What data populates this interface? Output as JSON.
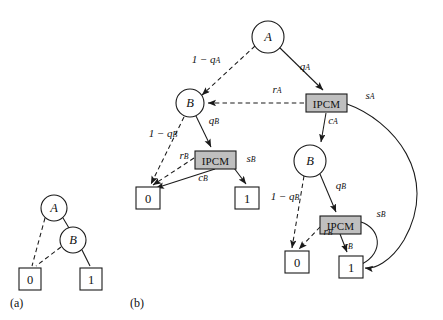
{
  "figure": {
    "background_color": "#ffffff",
    "stroke_color": "#1a1a1a",
    "ipcm_fill_color": "#bfbfbf",
    "panels": [
      {
        "id": "a",
        "caption": "(a)"
      },
      {
        "id": "b",
        "caption": "(b)"
      }
    ]
  },
  "panel_a": {
    "caption": "(a)",
    "nodes": [
      {
        "id": "a_A",
        "label": "A",
        "shape": "circle",
        "cx": 54,
        "cy": 208,
        "r": 13
      },
      {
        "id": "a_B",
        "label": "B",
        "shape": "circle",
        "cx": 73,
        "cy": 240,
        "r": 13
      },
      {
        "id": "a_leaf0",
        "label": "0",
        "shape": "box",
        "x": 19,
        "y": 268,
        "w": 22,
        "h": 22
      },
      {
        "id": "a_leaf1",
        "label": "1",
        "shape": "box",
        "x": 80,
        "y": 268,
        "w": 22,
        "h": 22
      }
    ],
    "edges": [
      {
        "from": "a_A",
        "to": "a_leaf0",
        "style": "dashed",
        "label": ""
      },
      {
        "from": "a_A",
        "to": "a_B",
        "style": "solid",
        "label": ""
      },
      {
        "from": "a_B",
        "to": "a_leaf0",
        "style": "dashed",
        "label": ""
      },
      {
        "from": "a_B",
        "to": "a_leaf1",
        "style": "solid",
        "label": ""
      }
    ]
  },
  "panel_b": {
    "caption": "(b)",
    "nodes": [
      {
        "id": "b_A",
        "label": "A",
        "shape": "circle",
        "cx": 268,
        "cy": 37,
        "r": 16
      },
      {
        "id": "b_B_left",
        "label": "B",
        "shape": "circle",
        "cx": 190,
        "cy": 103,
        "r": 14
      },
      {
        "id": "b_ipcm_A",
        "label": "IPCM",
        "shape": "ipcm",
        "x": 306,
        "y": 94,
        "w": 41,
        "h": 18
      },
      {
        "id": "b_ipcm_B_left",
        "label": "IPCM",
        "shape": "ipcm",
        "x": 195,
        "y": 151,
        "w": 41,
        "h": 18
      },
      {
        "id": "b_leaf0_left",
        "label": "0",
        "shape": "box",
        "x": 136,
        "y": 187,
        "w": 24,
        "h": 22
      },
      {
        "id": "b_leaf1_left",
        "label": "1",
        "shape": "box",
        "x": 235,
        "y": 187,
        "w": 24,
        "h": 22
      },
      {
        "id": "b_B_right",
        "label": "B",
        "shape": "circle",
        "cx": 310,
        "cy": 161,
        "r": 16
      },
      {
        "id": "b_ipcm_B_right",
        "label": "IPCM",
        "shape": "ipcm",
        "x": 320,
        "y": 216,
        "w": 41,
        "h": 18
      },
      {
        "id": "b_leaf0_right",
        "label": "0",
        "shape": "box",
        "x": 285,
        "y": 251,
        "w": 24,
        "h": 22
      },
      {
        "id": "b_leaf1_right",
        "label": "1",
        "shape": "box",
        "x": 339,
        "y": 256,
        "w": 24,
        "h": 22
      }
    ],
    "edge_labels": {
      "one_minus_qA": {
        "text": "1 − q",
        "sub": "A",
        "x": 206,
        "y": 59
      },
      "qA": {
        "text": "q",
        "sub": "A",
        "x": 305,
        "y": 66
      },
      "rA": {
        "text": "r",
        "sub": "A",
        "x": 277,
        "y": 89
      },
      "sA": {
        "text": "s",
        "sub": "A",
        "x": 370,
        "y": 95
      },
      "cA": {
        "text": "c",
        "sub": "A",
        "x": 333,
        "y": 120
      },
      "qB_left": {
        "text": "q",
        "sub": "B",
        "x": 214,
        "y": 120
      },
      "one_minus_qB_left": {
        "text": "1 − q",
        "sub": "B",
        "x": 163,
        "y": 133
      },
      "rB_left": {
        "text": "r",
        "sub": "B",
        "x": 184,
        "y": 155
      },
      "sB_left": {
        "text": "s",
        "sub": "B",
        "x": 251,
        "y": 158
      },
      "cB_left": {
        "text": "c",
        "sub": "B",
        "x": 203,
        "y": 177
      },
      "qB_right": {
        "text": "q",
        "sub": "B",
        "x": 341,
        "y": 185
      },
      "one_minus_qB_right": {
        "text": "1 − q",
        "sub": "B",
        "x": 285,
        "y": 196
      },
      "rB_right": {
        "text": "r",
        "sub": "B",
        "x": 328,
        "y": 231
      },
      "sB_right": {
        "text": "s",
        "sub": "B",
        "x": 381,
        "y": 213
      },
      "cB_right": {
        "text": "c",
        "sub": "B",
        "x": 348,
        "y": 245
      }
    },
    "edges": [
      {
        "from": "b_A",
        "to": "b_B_left",
        "style": "dashed",
        "label": "one_minus_qA"
      },
      {
        "from": "b_A",
        "to": "b_ipcm_A",
        "style": "solid",
        "label": "qA"
      },
      {
        "from": "b_ipcm_A",
        "to": "b_B_left",
        "style": "dashed",
        "label": "rA"
      },
      {
        "from": "b_ipcm_A",
        "to": "b_B_right",
        "style": "solid",
        "label": "cA"
      },
      {
        "from": "b_ipcm_A",
        "to": "b_leaf1_right",
        "style": "curve",
        "label": "sA"
      },
      {
        "from": "b_B_left",
        "to": "b_leaf0_left",
        "style": "dashed",
        "label": "one_minus_qB_left"
      },
      {
        "from": "b_B_left",
        "to": "b_ipcm_B_left",
        "style": "solid",
        "label": "qB_left"
      },
      {
        "from": "b_ipcm_B_left",
        "to": "b_leaf0_left",
        "style": "dashed",
        "label": "rB_left"
      },
      {
        "from": "b_ipcm_B_left",
        "to": "b_leaf0_left",
        "style": "solid",
        "label": "cB_left"
      },
      {
        "from": "b_ipcm_B_left",
        "to": "b_leaf1_left",
        "style": "solid",
        "label": "sB_left"
      },
      {
        "from": "b_B_right",
        "to": "b_leaf0_right",
        "style": "dashed",
        "label": "one_minus_qB_right"
      },
      {
        "from": "b_B_right",
        "to": "b_ipcm_B_right",
        "style": "solid",
        "label": "qB_right"
      },
      {
        "from": "b_ipcm_B_right",
        "to": "b_leaf0_right",
        "style": "dashed",
        "label": "rB_right"
      },
      {
        "from": "b_ipcm_B_right",
        "to": "b_leaf1_right",
        "style": "solid",
        "label": "cB_right"
      },
      {
        "from": "b_ipcm_B_right",
        "to": "b_leaf1_right",
        "style": "curve",
        "label": "sB_right"
      }
    ]
  }
}
